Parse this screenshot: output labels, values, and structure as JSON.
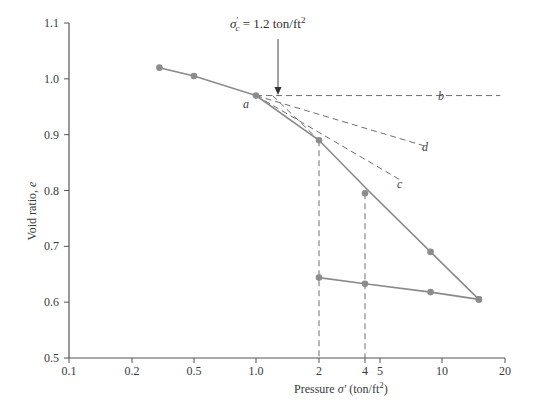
{
  "chart_data": {
    "type": "line",
    "title": "",
    "xlabel": "Pressure σ′ (ton/ft²)",
    "ylabel": "Void ratio, e",
    "xscale": "log",
    "xlim": [
      0.1,
      20
    ],
    "ylim": [
      0.5,
      1.1
    ],
    "grid": false,
    "legend": null,
    "x_ticks": [
      {
        "label": "0.1",
        "value": 0.1,
        "px": 69
      },
      {
        "label": "0.2",
        "value": 0.2,
        "px": 132
      },
      {
        "label": "0.5",
        "value": 0.5,
        "px": 194
      },
      {
        "label": "1.0",
        "value": 1.0,
        "px": 256
      },
      {
        "label": "2",
        "value": 2,
        "px": 319
      },
      {
        "label": "4",
        "value": 4,
        "px": 365
      },
      {
        "label": "5",
        "value": 5,
        "px": 380
      },
      {
        "label": "10",
        "value": 10,
        "px": 442
      },
      {
        "label": "20",
        "value": 20,
        "px": 505
      }
    ],
    "y_ticks": [
      {
        "label": "1.1",
        "value": 1.1
      },
      {
        "label": "1.0",
        "value": 1.0
      },
      {
        "label": "0.9",
        "value": 0.9
      },
      {
        "label": "0.8",
        "value": 0.8
      },
      {
        "label": "0.7",
        "value": 0.7
      },
      {
        "label": "0.6",
        "value": 0.6
      },
      {
        "label": "0.5",
        "value": 0.5
      }
    ],
    "series": [
      {
        "name": "Loading (virgin compression)",
        "style": "solid-with-markers",
        "x": [
          0.3,
          0.5,
          1.0,
          2.0,
          4.0,
          8.8,
          15.0
        ],
        "y": [
          1.02,
          1.005,
          0.97,
          0.89,
          0.795,
          0.69,
          0.605
        ]
      },
      {
        "name": "Unloading (rebound)",
        "style": "solid-with-markers",
        "x": [
          15.0,
          8.8,
          4.0,
          2.0
        ],
        "y": [
          0.605,
          0.618,
          0.633,
          0.644
        ]
      }
    ],
    "construction_lines": [
      {
        "label": "b",
        "description": "horizontal line from point a",
        "from": [
          1.0,
          0.97
        ],
        "to": [
          19,
          0.97
        ]
      },
      {
        "label": "c",
        "description": "tangent at point a",
        "from": [
          1.0,
          0.97
        ],
        "to": [
          6.2,
          0.82
        ]
      },
      {
        "label": "d",
        "description": "bisector of angle bac",
        "from": [
          1.0,
          0.97
        ],
        "to": [
          8.2,
          0.88
        ]
      },
      {
        "label": "",
        "description": "backward extension of virgin compression line",
        "from": [
          1.2,
          0.97
        ],
        "to": [
          2.0,
          0.89
        ]
      }
    ],
    "vertical_guides": [
      {
        "x": 2,
        "from_e": 0.89,
        "to_e": 0.5
      },
      {
        "x": 4,
        "from_e": 0.795,
        "to_e": 0.5
      }
    ],
    "annotations": [
      {
        "text_main": "σ′c = 1.2 ton/ft²",
        "symbol": "σ",
        "prime": "′",
        "subscript": "c",
        "value": "= 1.2 ton/ft",
        "superscript": "2",
        "arrow_to": [
          1.2,
          0.97
        ]
      },
      {
        "text": "a",
        "at": [
          1.0,
          0.97
        ]
      },
      {
        "text": "b"
      },
      {
        "text": "c"
      },
      {
        "text": "d"
      }
    ]
  },
  "labels": {
    "xlabel_main": "Pressure ",
    "xlabel_sym": "σ′",
    "xlabel_unit": " (ton/ft",
    "xlabel_sup": "2",
    "xlabel_close": ")",
    "ylabel_main": "Void ratio, ",
    "ylabel_sym": "e",
    "annot_sym": "σ",
    "annot_sub": "c",
    "annot_prime": "′",
    "annot_text": " = 1.2 ton/ft",
    "annot_sup": "2",
    "point_a": "a",
    "point_b": "b",
    "point_c": "c",
    "point_d": "d"
  },
  "colors": {
    "axis": "#555555",
    "curve": "#8a8a8a",
    "marker": "#8c8c8c",
    "dashed": "#6e6e6e",
    "text": "#3a3a3a"
  }
}
